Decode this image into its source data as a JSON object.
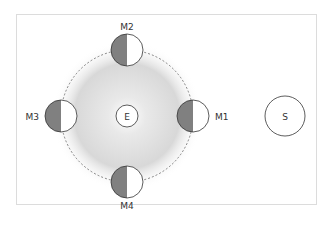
{
  "diagram": {
    "earth": {
      "label": "E"
    },
    "sun": {
      "label": "S"
    },
    "moons": [
      {
        "id": "M1",
        "label": "M1",
        "position": "right"
      },
      {
        "id": "M2",
        "label": "M2",
        "position": "top"
      },
      {
        "id": "M3",
        "label": "M3",
        "position": "left"
      },
      {
        "id": "M4",
        "label": "M4",
        "position": "bottom"
      }
    ],
    "colors": {
      "shadow": "#808080",
      "lit": "#ffffff",
      "outline": "#333333",
      "orbit": "#555555",
      "glow": "#cfcfcf"
    }
  }
}
